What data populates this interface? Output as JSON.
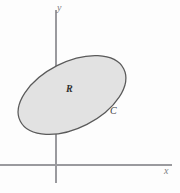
{
  "figure": {
    "background_color": "#fdfdfd",
    "axes": {
      "x_axis_label": "x",
      "y_axis_label": "y",
      "axis_color": "#9a9a9e",
      "origin": {
        "x": 56,
        "y": 165
      },
      "x_axis_extent": {
        "from_x": 0,
        "to_x": 172,
        "y": 165
      },
      "y_axis_extent": {
        "from_y": 10,
        "to_y": 183,
        "x": 56
      }
    },
    "region": {
      "label": "R",
      "label_position": {
        "x": 71,
        "y": 90
      },
      "fill_color": "#e2e2e2",
      "stroke_color": "#5a5a5a",
      "shape": "ellipse",
      "center": {
        "x": 72,
        "y": 95
      },
      "semi_major_axis": 58,
      "semi_minor_axis": 33,
      "rotation_degrees": -27
    },
    "boundary_curve": {
      "label": "C",
      "label_position": {
        "x": 114,
        "y": 112
      },
      "description": "positively oriented simple closed curve bounding region R"
    }
  }
}
